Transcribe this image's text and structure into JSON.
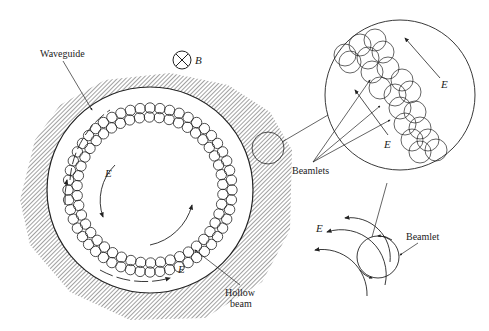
{
  "diagram": {
    "type": "physics-schematic",
    "labels": {
      "waveguide": "Waveguide",
      "magnetic_field": "B",
      "hollow_beam_line1": "Hollow",
      "hollow_beam_line2": "beam",
      "beamlets": "Beamlets",
      "beamlet": "Beamlet",
      "e_field_inner": "E",
      "e_field_outer": "E",
      "e_field_zoom_top": "E",
      "e_field_zoom_mid": "E",
      "e_field_single": "E"
    },
    "symbols": {
      "magnetic_field_symbol": "circle-with-cross (B into page)"
    },
    "colors": {
      "line": "#222222",
      "background": "#ffffff",
      "hatch": "#444444"
    }
  }
}
